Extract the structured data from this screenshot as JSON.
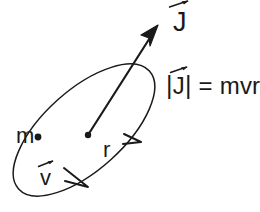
{
  "figure": {
    "background_color": "#ffffff",
    "stroke_color": "#1a1a1a"
  },
  "labels": {
    "angular_momentum_vector": "J",
    "magnitude_equation": {
      "left_bar": "|",
      "symbol": "J",
      "right_bar": "|",
      "tail": "= mvr",
      "full": "|J| = mvr"
    },
    "mass": "m",
    "radius": "r",
    "velocity_vector": "v"
  },
  "icons": {
    "vector_arrow": "vector-arrow-accent",
    "orbit": "ellipse-orbit",
    "mass_point": "filled-dot",
    "center_point": "filled-dot",
    "j_arrow": "arrow-up-right",
    "motion_arrowheads": "direction-of-motion-arrowhead"
  },
  "geometry": {
    "orbit_ellipse": {
      "center_x": 84,
      "center_y": 130,
      "radius_x": 88,
      "radius_y": 40,
      "rotation_deg": 42
    },
    "center_dot": {
      "x": 88,
      "y": 135,
      "r": 3.2
    },
    "mass_dot": {
      "x": 38,
      "y": 137,
      "r": 3.4
    },
    "j_vector": {
      "x1": 88,
      "y1": 135,
      "x2": 157,
      "y2": 27
    }
  }
}
